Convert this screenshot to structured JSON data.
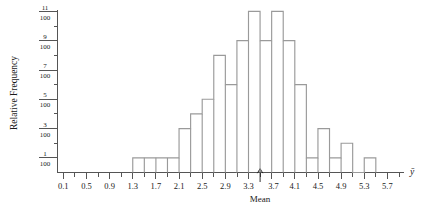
{
  "chart_data": {
    "type": "bar",
    "title": "",
    "subtitle": "",
    "xlabel": "Mean",
    "ylabel": "Relative Frequency",
    "x_axis_symbol": "ȳ",
    "bin_width": 0.2,
    "x_tick_labels": [
      "0.1",
      "0.5",
      "0.9",
      "1.3",
      "1.7",
      "2.1",
      "2.5",
      "2.9",
      "3.3",
      "3.7",
      "4.1",
      "4.5",
      "4.9",
      "5.3",
      "5.7"
    ],
    "x_tick_values": [
      0.1,
      0.5,
      0.9,
      1.3,
      1.7,
      2.1,
      2.5,
      2.9,
      3.3,
      3.7,
      4.1,
      4.5,
      4.9,
      5.3,
      5.7
    ],
    "x_minor_tick_values": [
      0.3,
      0.7,
      1.1,
      1.5,
      1.9,
      2.3,
      2.7,
      3.1,
      3.5,
      3.9,
      4.3,
      4.7,
      5.1,
      5.5,
      5.9
    ],
    "xlim": [
      0.0,
      6.0
    ],
    "y_tick_labels": [
      "1/100",
      "3/100",
      "5/100",
      "7/100",
      "9/100",
      "11/100"
    ],
    "y_tick_numerators": [
      "1",
      "3",
      "5",
      "7",
      "9",
      "11"
    ],
    "y_tick_denominator": "100",
    "y_tick_values": [
      1,
      3,
      5,
      7,
      9,
      11
    ],
    "y_minor_tick_values": [
      2,
      4,
      6,
      8,
      10
    ],
    "ylim": [
      0,
      11
    ],
    "y_units": "hundredths",
    "grid": false,
    "legend": false,
    "annotations": [
      {
        "name": "mean-arrow",
        "label": "Mean",
        "x": 3.5,
        "type": "up-arrow-below-axis"
      }
    ],
    "categories": [
      "1.3",
      "1.5",
      "1.7",
      "1.9",
      "2.1",
      "2.3",
      "2.5",
      "2.7",
      "2.9",
      "3.1",
      "3.3",
      "3.5",
      "3.7",
      "3.9",
      "4.1",
      "4.3",
      "4.5",
      "4.7",
      "4.9",
      "5.1",
      "5.3"
    ],
    "bin_starts": [
      1.3,
      1.5,
      1.7,
      1.9,
      2.1,
      2.3,
      2.5,
      2.7,
      2.9,
      3.1,
      3.3,
      3.5,
      3.7,
      3.9,
      4.1,
      4.3,
      4.5,
      4.7,
      4.9,
      5.1,
      5.3
    ],
    "values": [
      1,
      1,
      1,
      1,
      3,
      4,
      5,
      8,
      6,
      9,
      11,
      9,
      11,
      9,
      6,
      1,
      3,
      1,
      2,
      0,
      1
    ]
  },
  "figure": {
    "axis_caption": "Mean",
    "y_axis_title": "Relative Frequency",
    "x_axis_variable": "ȳ",
    "colors": {
      "bar_stroke": "#9a9a9a",
      "axis": "#555555",
      "text": "#1a1a1a",
      "background": "#ffffff"
    }
  }
}
